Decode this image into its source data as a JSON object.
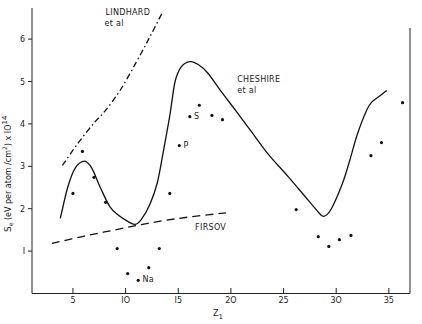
{
  "chart_data": {
    "type": "line",
    "title": "",
    "xlabel": "Z",
    "xlabel_sub": "1",
    "ylabel": "S_e (eV per atom /cm²) x 10^14",
    "ylabel_parts": {
      "main": "S",
      "sub": "e",
      "mid": " (eV per atom /cm",
      "sup": "2",
      "tail": ") x IO",
      "exp": "14"
    },
    "xlim": [
      1.1,
      37
    ],
    "ylim": [
      0,
      6.8
    ],
    "xticks": [
      5,
      10,
      15,
      20,
      25,
      30,
      35
    ],
    "xtick_labels": [
      "5",
      "IO",
      "I5",
      "2O",
      "25",
      "3O",
      "35"
    ],
    "yticks": [
      1,
      2,
      3,
      4,
      5,
      6
    ],
    "ytick_labels": [
      "I",
      "2",
      "3",
      "4",
      "5",
      "6"
    ],
    "grid": false,
    "legend": null,
    "series": [
      {
        "name": "LINDHARD et al",
        "style": "dash-dot",
        "x": [
          4.0,
          5.5,
          7.0,
          8.1,
          9.5,
          11.0,
          12.3,
          13.5
        ],
        "y": [
          3.02,
          3.55,
          4.02,
          4.32,
          4.8,
          5.45,
          6.05,
          6.63
        ]
      },
      {
        "name": "CHESHIRE et al",
        "style": "solid",
        "x": [
          3.8,
          4.5,
          5.2,
          6.1,
          6.8,
          7.6,
          8.5,
          9.3,
          10.2,
          10.9,
          11.5,
          12.3,
          13.0,
          13.6,
          14.2,
          14.7,
          15.3,
          16.1,
          16.9,
          17.8,
          19.0,
          20.5,
          22.0,
          23.5,
          25.5,
          27.0,
          28.2,
          28.8,
          29.5,
          30.6,
          31.3,
          32.0,
          32.9,
          33.4,
          34.1,
          34.8
        ],
        "y": [
          1.77,
          2.5,
          2.95,
          3.12,
          2.95,
          2.5,
          2.05,
          1.85,
          1.7,
          1.63,
          1.75,
          2.1,
          2.6,
          3.37,
          4.2,
          5.0,
          5.35,
          5.47,
          5.4,
          5.2,
          4.79,
          4.3,
          3.8,
          3.3,
          2.74,
          2.3,
          1.95,
          1.82,
          1.98,
          2.6,
          3.15,
          3.75,
          4.33,
          4.52,
          4.65,
          4.79
        ]
      },
      {
        "name": "FIRSOV",
        "style": "dashed",
        "x": [
          3.0,
          6.0,
          9.0,
          12.0,
          15.0,
          18.0,
          19.9
        ],
        "y": [
          1.18,
          1.35,
          1.5,
          1.65,
          1.77,
          1.86,
          1.91
        ]
      },
      {
        "name": "experimental",
        "style": "points",
        "x": [
          5.0,
          5.9,
          7.0,
          8.1,
          9.2,
          10.2,
          11.2,
          12.2,
          13.2,
          14.2,
          15.1,
          16.1,
          17.0,
          18.2,
          19.2,
          26.2,
          28.3,
          29.3,
          30.3,
          31.4,
          33.3,
          34.3,
          36.3
        ],
        "y": [
          2.36,
          3.35,
          2.74,
          2.15,
          1.06,
          0.47,
          0.31,
          0.61,
          1.06,
          2.36,
          3.49,
          4.17,
          4.44,
          4.2,
          4.1,
          1.98,
          1.34,
          1.11,
          1.27,
          1.37,
          3.25,
          3.56,
          4.5
        ]
      }
    ],
    "annotations": [
      {
        "text": "LINDHARD",
        "x": 8.1,
        "y": 6.58
      },
      {
        "text": "et al",
        "x": 8.0,
        "y": 6.32
      },
      {
        "text": "CHESHIRE",
        "x": 20.6,
        "y": 4.98
      },
      {
        "text": "et al",
        "x": 20.6,
        "y": 4.72
      },
      {
        "text": "FIRSOV",
        "x": 16.6,
        "y": 1.5
      },
      {
        "text": "Na",
        "x": 11.6,
        "y": 0.26,
        "point": [
          11.2,
          0.31
        ]
      },
      {
        "text": "P",
        "x": 15.5,
        "y": 3.44,
        "point": [
          15.1,
          3.49
        ]
      },
      {
        "text": "S",
        "x": 16.5,
        "y": 4.12,
        "point": [
          16.1,
          4.17
        ]
      }
    ]
  }
}
